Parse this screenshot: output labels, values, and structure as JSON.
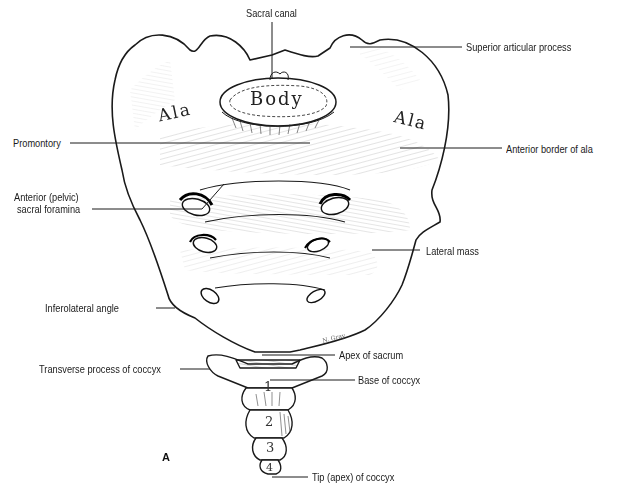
{
  "figure": {
    "panel_letter": "A",
    "bone_labels": {
      "body": "Body",
      "ala_left": "Ala",
      "ala_right": "Ala"
    },
    "coccyx_segments": [
      "1",
      "2",
      "3",
      "4"
    ],
    "signature": "N. Gray",
    "callouts": {
      "sacral_canal": "Sacral canal",
      "superior_articular_process": "Superior articular process",
      "promontory": "Promontory",
      "anterior_border_of_ala": "Anterior border of ala",
      "anterior_pelvic_sacral_foramina_line1": "Anterior (pelvic)",
      "anterior_pelvic_sacral_foramina_line2": "sacral foramina",
      "lateral_mass": "Lateral mass",
      "inferolateral_angle": "Inferolateral angle",
      "apex_of_sacrum": "Apex of sacrum",
      "transverse_process_of_coccyx": "Transverse process of coccyx",
      "base_of_coccyx": "Base of coccyx",
      "tip_apex_of_coccyx": "Tip (apex) of coccyx"
    },
    "colors": {
      "ink": "#1a1a1a",
      "paper": "#ffffff",
      "hatch": "#3a3a3a"
    }
  }
}
